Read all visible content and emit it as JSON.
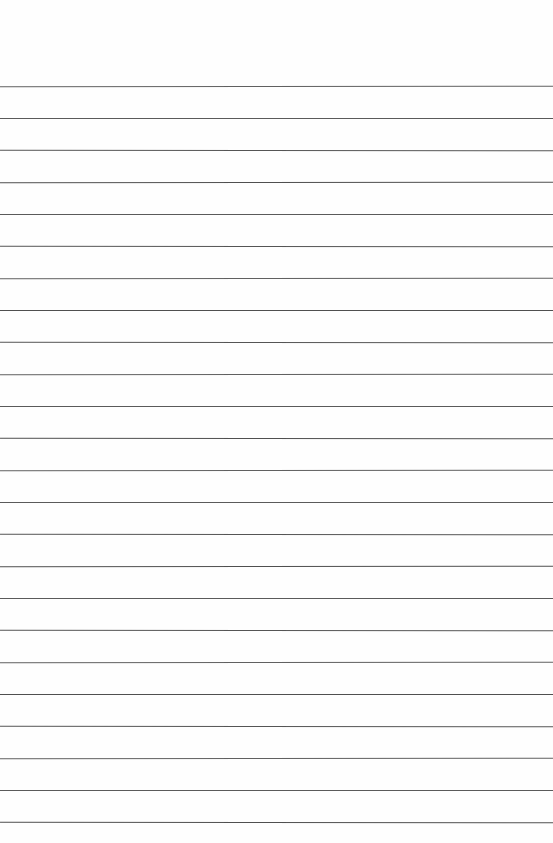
{
  "page": {
    "type": "blank-lined-notebook-page",
    "background_color": "#fefefe",
    "text_content": "",
    "ruled_lines": {
      "count": 24,
      "color": "#5a5a5a"
    }
  }
}
